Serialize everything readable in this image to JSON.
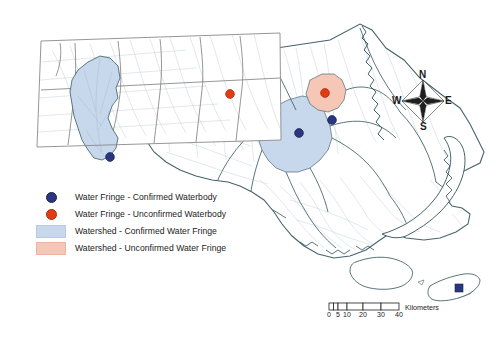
{
  "figure": {
    "kind": "thematic-map",
    "region": "Massachusetts",
    "background_color": "#ffffff"
  },
  "colors": {
    "confirmed_dot": "#29377f",
    "unconfirmed_dot": "#e23c12",
    "confirmed_watershed_fill": "#c7d7ec",
    "unconfirmed_watershed_fill": "#f6c6b6",
    "watershed_outline": "#3f5f66",
    "state_outline": "#5a5a5a",
    "stream_line": "#b9c9d6",
    "inset_border": "#8a8a8a"
  },
  "legend": {
    "items": [
      {
        "key": "confirmed-dot",
        "symbol": "circle",
        "color": "#29377f",
        "label": "Water Fringe - Confirmed Waterbody"
      },
      {
        "key": "unconfirmed-dot",
        "symbol": "circle",
        "color": "#e23c12",
        "label": "Water Fringe - Unconfirmed Waterbody"
      },
      {
        "key": "confirmed-fringe",
        "symbol": "swatch",
        "color": "#c7d7ec",
        "label": "Watershed - Confirmed Water Fringe"
      },
      {
        "key": "unconfirmed-fringe",
        "symbol": "swatch",
        "color": "#f6c6b6",
        "label": "Watershed - Unconfirmed Water Fringe"
      }
    ]
  },
  "compass": {
    "north": "N",
    "south": "S",
    "east": "E",
    "west": "W"
  },
  "scalebar": {
    "units_label": "Kilometers",
    "ticks": [
      "0",
      "5",
      "10",
      "20",
      "30",
      "40"
    ],
    "tick_positions_px": [
      0,
      9,
      18,
      34,
      52,
      70
    ],
    "max_value": 40
  },
  "map_features": {
    "inset_panel": {
      "present": true,
      "description": "rotated rectangular inset of western Massachusetts"
    },
    "watersheds": [
      {
        "id": "westfield",
        "status": "confirmed",
        "fill": "#c7d7ec",
        "location": "inset-western"
      },
      {
        "id": "central-red",
        "status": "unconfirmed",
        "fill": "#f6c6b6",
        "location": "north-central"
      },
      {
        "id": "eastern-blue",
        "status": "confirmed",
        "fill": "#c7d7ec",
        "location": "east-central"
      },
      {
        "id": "boston-red",
        "status": "unconfirmed",
        "fill": "#f6c6b6",
        "location": "northeast"
      },
      {
        "id": "nantucket",
        "status": "confirmed",
        "fill": "#c7d7ec",
        "location": "nantucket-island"
      }
    ],
    "waterbody_points": [
      {
        "status": "confirmed",
        "location": "inset-southwest"
      },
      {
        "status": "unconfirmed",
        "location": "north-central"
      },
      {
        "status": "unconfirmed",
        "location": "northeast"
      },
      {
        "status": "confirmed",
        "location": "east-central"
      },
      {
        "status": "confirmed",
        "location": "east-coastal"
      },
      {
        "status": "confirmed",
        "location": "nantucket-island"
      }
    ]
  }
}
